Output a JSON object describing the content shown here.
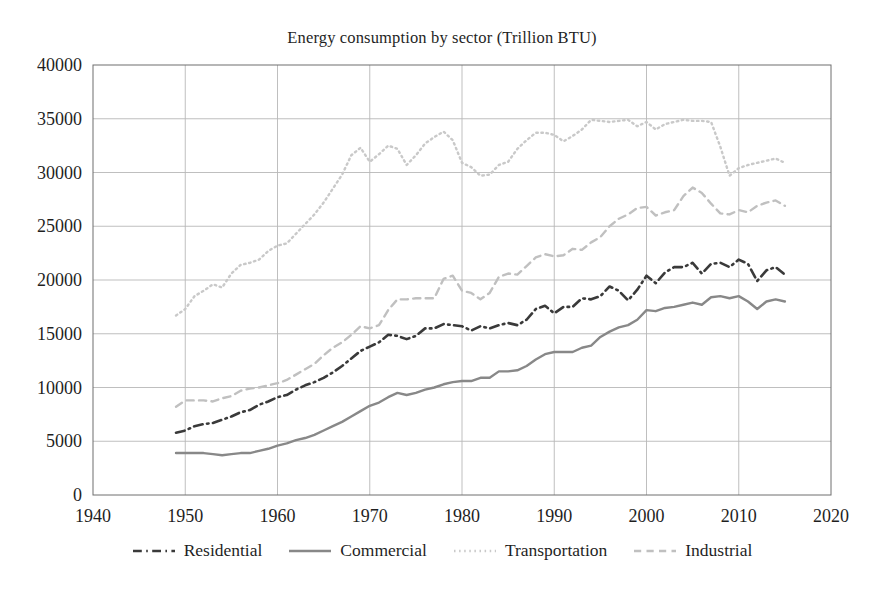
{
  "chart_data": {
    "type": "line",
    "title": "Energy consumption by sector (Trillion BTU)",
    "xlabel": "",
    "ylabel": "",
    "xlim": [
      1940,
      2020
    ],
    "ylim": [
      0,
      40000
    ],
    "xticks": [
      1940,
      1950,
      1960,
      1970,
      1980,
      1990,
      2000,
      2010,
      2020
    ],
    "xtick_labels": [
      "1940",
      "1950",
      "1960",
      "1970",
      "1980",
      "1990",
      "2000",
      "2010",
      "2020"
    ],
    "yticks": [
      0,
      5000,
      10000,
      15000,
      20000,
      25000,
      30000,
      35000,
      40000
    ],
    "ytick_labels": [
      "0",
      "5000",
      "10000",
      "15000",
      "20000",
      "25000",
      "30000",
      "35000",
      "40000"
    ],
    "grid": true,
    "grid_color": "#b8b8b8",
    "legend_position": "below",
    "x": [
      1949,
      1950,
      1951,
      1952,
      1953,
      1954,
      1955,
      1956,
      1957,
      1958,
      1959,
      1960,
      1961,
      1962,
      1963,
      1964,
      1965,
      1966,
      1967,
      1968,
      1969,
      1970,
      1971,
      1972,
      1973,
      1974,
      1975,
      1976,
      1977,
      1978,
      1979,
      1980,
      1981,
      1982,
      1983,
      1984,
      1985,
      1986,
      1987,
      1988,
      1989,
      1990,
      1991,
      1992,
      1993,
      1994,
      1995,
      1996,
      1997,
      1998,
      1999,
      2000,
      2001,
      2002,
      2003,
      2004,
      2005,
      2006,
      2007,
      2008,
      2009,
      2010,
      2011,
      2012,
      2013,
      2014,
      2015
    ],
    "series": [
      {
        "name": "Residential",
        "style": "dashdot",
        "color": "#3a3a3a",
        "width": 2.6,
        "values": [
          5800,
          6000,
          6400,
          6600,
          6700,
          7000,
          7300,
          7700,
          7900,
          8400,
          8700,
          9100,
          9300,
          9800,
          10200,
          10500,
          10900,
          11400,
          12000,
          12700,
          13400,
          13800,
          14200,
          14900,
          14800,
          14500,
          14800,
          15500,
          15500,
          15900,
          15800,
          15700,
          15300,
          15700,
          15500,
          15800,
          16000,
          15800,
          16300,
          17300,
          17600,
          16900,
          17500,
          17500,
          18300,
          18200,
          18500,
          19400,
          19000,
          18100,
          19100,
          20400,
          19700,
          20700,
          21200,
          21200,
          21600,
          20600,
          21500,
          21600,
          21200,
          21900,
          21500,
          19900,
          20900,
          21200,
          20500
        ]
      },
      {
        "name": "Commercial",
        "style": "solid",
        "color": "#888888",
        "width": 2.4,
        "values": [
          3900,
          3900,
          3900,
          3900,
          3800,
          3700,
          3800,
          3900,
          3900,
          4100,
          4300,
          4600,
          4800,
          5100,
          5300,
          5600,
          6000,
          6400,
          6800,
          7300,
          7800,
          8300,
          8600,
          9100,
          9500,
          9300,
          9500,
          9800,
          10000,
          10300,
          10500,
          10600,
          10600,
          10900,
          10900,
          11500,
          11500,
          11600,
          12000,
          12600,
          13100,
          13300,
          13300,
          13300,
          13700,
          13900,
          14700,
          15200,
          15600,
          15800,
          16300,
          17200,
          17100,
          17400,
          17500,
          17700,
          17900,
          17700,
          18400,
          18500,
          18300,
          18500,
          18000,
          17300,
          18000,
          18200,
          18000
        ]
      },
      {
        "name": "Transportation",
        "style": "dotted",
        "color": "#c9c9c9",
        "width": 2.4,
        "values": [
          16700,
          17300,
          18500,
          19000,
          19600,
          19300,
          20600,
          21400,
          21600,
          21900,
          22700,
          23200,
          23400,
          24300,
          25200,
          26100,
          27200,
          28500,
          29800,
          31600,
          32300,
          31000,
          31700,
          32500,
          32200,
          30700,
          31600,
          32700,
          33300,
          33800,
          33000,
          30900,
          30500,
          29700,
          29800,
          30700,
          31000,
          32200,
          33000,
          33700,
          33700,
          33500,
          32900,
          33400,
          34000,
          34900,
          34800,
          34700,
          34800,
          34900,
          34300,
          34700,
          34000,
          34500,
          34700,
          34900,
          34800,
          34800,
          34700,
          32400,
          29700,
          30400,
          30700,
          30900,
          31100,
          31300,
          30900
        ]
      },
      {
        "name": "Industrial",
        "style": "dashed",
        "color": "#c0c0c0",
        "width": 2.4,
        "values": [
          8200,
          8800,
          8800,
          8800,
          8700,
          9000,
          9200,
          9700,
          9900,
          10000,
          10200,
          10400,
          10700,
          11200,
          11700,
          12200,
          13000,
          13700,
          14200,
          14900,
          15700,
          15500,
          15800,
          17200,
          18200,
          18200,
          18300,
          18300,
          18300,
          20100,
          20400,
          19000,
          18800,
          18200,
          18800,
          20300,
          20600,
          20500,
          21300,
          22100,
          22400,
          22200,
          22300,
          22900,
          22800,
          23500,
          24000,
          25000,
          25700,
          26100,
          26700,
          26800,
          26000,
          26300,
          26500,
          27800,
          28600,
          28100,
          27100,
          26200,
          26100,
          26500,
          26300,
          26900,
          27200,
          27400,
          26900
        ]
      }
    ]
  },
  "axes": {
    "title": "Energy consumption by sector (Trillion BTU)"
  }
}
